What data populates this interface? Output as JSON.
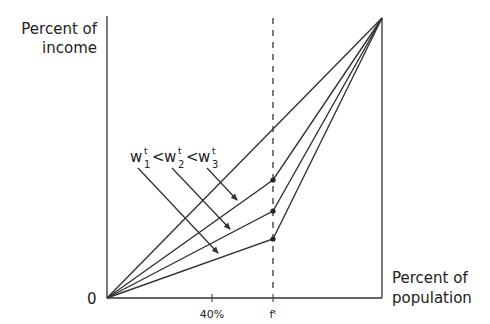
{
  "diagram": {
    "y_axis_label_line1": "Percent of",
    "y_axis_label_line2": "income",
    "x_axis_label_line1": "Percent of",
    "x_axis_label_line2": "population",
    "origin_label": "0",
    "x_ticks": [
      {
        "label": "40%",
        "position_fraction": 0.4
      },
      {
        "label": "fᵗ",
        "position_fraction": 0.605
      }
    ],
    "annotation": {
      "w1": "w",
      "w1_sub": "1",
      "w1_sup": "t",
      "lt1": "<",
      "w2": "w",
      "w2_sub": "2",
      "w2_sup": "t",
      "lt2": "<",
      "w3": "w",
      "w3_sub": "3",
      "w3_sup": "t"
    },
    "curves": [
      {
        "name": "line-of-equality",
        "points": [
          [
            0,
            0
          ],
          [
            1,
            1
          ]
        ]
      },
      {
        "name": "curve-w3",
        "points": [
          [
            0,
            0
          ],
          [
            0.605,
            0.42
          ],
          [
            1,
            1
          ]
        ]
      },
      {
        "name": "curve-w2",
        "points": [
          [
            0,
            0
          ],
          [
            0.605,
            0.31
          ],
          [
            1,
            1
          ]
        ]
      },
      {
        "name": "curve-w1",
        "points": [
          [
            0,
            0
          ],
          [
            0.605,
            0.21
          ],
          [
            1,
            1
          ]
        ]
      }
    ],
    "line_color": "#333333"
  }
}
